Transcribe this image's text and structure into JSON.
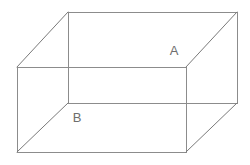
{
  "figure": {
    "kind": "wireframe-cuboid",
    "title": "Rectangular box wireframe diagram",
    "projection": "oblique",
    "canvas": {
      "width": 250,
      "height": 165,
      "background": "#ffffff"
    },
    "style": {
      "line_color": "#8c8c8c",
      "line_color_dark": "#7a7a7a",
      "line_width": 1,
      "label_color": "#6e6e6e",
      "label_font_size": 13
    },
    "vertices": {
      "front_top_left": {
        "x": 17,
        "y": 67
      },
      "front_top_right": {
        "x": 186,
        "y": 67
      },
      "front_bottom_right": {
        "x": 186,
        "y": 152
      },
      "front_bottom_left": {
        "x": 17,
        "y": 152
      },
      "back_top_left": {
        "x": 68,
        "y": 12
      },
      "back_top_right": {
        "x": 237,
        "y": 12
      },
      "back_bottom_right": {
        "x": 237,
        "y": 103
      },
      "back_bottom_left": {
        "x": 68,
        "y": 103
      }
    },
    "edges": [
      {
        "name": "front-face-top",
        "from": "front_top_left",
        "to": "front_top_right"
      },
      {
        "name": "front-face-right",
        "from": "front_top_right",
        "to": "front_bottom_right"
      },
      {
        "name": "front-face-bottom",
        "from": "front_bottom_right",
        "to": "front_bottom_left"
      },
      {
        "name": "front-face-left",
        "from": "front_bottom_left",
        "to": "front_top_left"
      },
      {
        "name": "back-face-top",
        "from": "back_top_left",
        "to": "back_top_right"
      },
      {
        "name": "back-face-right",
        "from": "back_top_right",
        "to": "back_bottom_right"
      },
      {
        "name": "back-face-bottom",
        "from": "back_bottom_right",
        "to": "back_bottom_left"
      },
      {
        "name": "back-face-left",
        "from": "back_bottom_left",
        "to": "back_top_left"
      },
      {
        "name": "oblique-top-left",
        "from": "front_top_left",
        "to": "back_top_left"
      },
      {
        "name": "oblique-top-right",
        "from": "front_top_right",
        "to": "back_top_right"
      },
      {
        "name": "oblique-bottom-right",
        "from": "front_bottom_right",
        "to": "back_bottom_right"
      },
      {
        "name": "oblique-bottom-left",
        "from": "front_bottom_left",
        "to": "back_bottom_left"
      }
    ],
    "labels": [
      {
        "id": "label_a",
        "text": "A",
        "x": 174,
        "y": 55,
        "describes": "right-side-face"
      },
      {
        "id": "label_b",
        "text": "B",
        "x": 77,
        "y": 122,
        "describes": "front-bottom-face"
      }
    ]
  }
}
